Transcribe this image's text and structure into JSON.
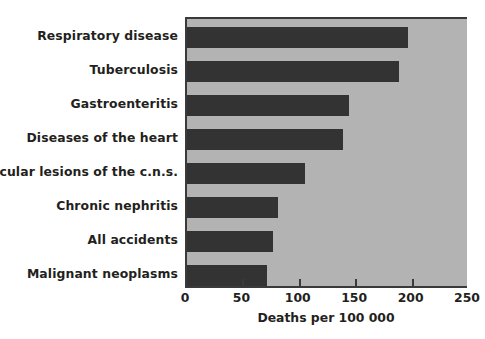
{
  "chart_data": {
    "type": "bar",
    "orientation": "horizontal",
    "title": "",
    "xlabel": "Deaths per 100 000",
    "ylabel": "",
    "xlim": [
      0,
      250
    ],
    "xticks": [
      0,
      50,
      100,
      150,
      200,
      250
    ],
    "xtick_labels": [
      "0",
      "50",
      "100",
      "150",
      "200",
      "250"
    ],
    "grid": false,
    "legend": null,
    "categories": [
      "Respiratory disease",
      "Tuberculosis",
      "Gastroenteritis",
      "Diseases of the heart",
      "Vascular lesions of the c.n.s.",
      "Chronic nephritis",
      "All accidents",
      "Malignant neoplasms"
    ],
    "values": [
      196,
      188,
      144,
      138,
      105,
      81,
      76,
      71
    ],
    "colors": {
      "bar": "#333333",
      "plot_background": "#b3b3b3",
      "page_background": "#ffffff",
      "axis": "#3a3a3a",
      "text": "#231f20"
    }
  }
}
